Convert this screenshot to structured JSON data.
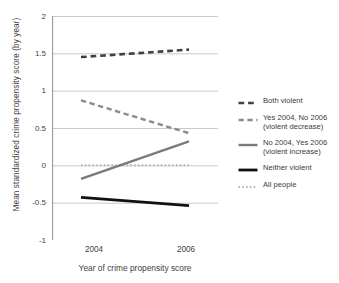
{
  "chart_data": {
    "type": "line",
    "title": "",
    "xlabel": "Year of crime propensity score",
    "ylabel": "Mean standardized crime propensity score (by year)",
    "categories": [
      "2004",
      "2006"
    ],
    "x": [
      2004,
      2006
    ],
    "ylim": [
      -1,
      2
    ],
    "yticks": [
      "2",
      "1.5",
      "1",
      "0.5",
      "0",
      "-0.5",
      "-1"
    ],
    "ytick_values": [
      2,
      1.5,
      1,
      0.5,
      0,
      -0.5,
      -1
    ],
    "grid": true,
    "legend_position": "right",
    "series": [
      {
        "name": "Both violent",
        "label": "Both violent",
        "values": [
          1.45,
          1.55
        ],
        "style": "dashed",
        "color": "#404040",
        "width": 2.6
      },
      {
        "name": "Yes 2004, No 2006 (violent decrease)",
        "label": "Yes 2004, No 2006\n(violent decrease)",
        "values": [
          0.87,
          0.43
        ],
        "style": "dashed",
        "color": "#8a8a8a",
        "width": 2.4
      },
      {
        "name": "No 2004, Yes 2006 (violent increase)",
        "label": "No 2004, Yes 2006\n(violent increase)",
        "values": [
          -0.18,
          0.32
        ],
        "style": "solid",
        "color": "#7a7a7a",
        "width": 2.4
      },
      {
        "name": "Neither violent",
        "label": "Neither violent",
        "values": [
          -0.43,
          -0.54
        ],
        "style": "solid",
        "color": "#111111",
        "width": 2.8
      },
      {
        "name": "All people",
        "label": "All people",
        "values": [
          0.0,
          0.0
        ],
        "style": "dotted",
        "color": "#b4b4b4",
        "width": 2.0
      }
    ]
  },
  "axes": {
    "y_title": "Mean standardized crime propensity score (by year)",
    "x_title": "Year of crime propensity score",
    "y_ticks": [
      "2",
      "1.5",
      "1",
      "0.5",
      "0",
      "-0.5",
      "-1"
    ],
    "x_ticks": [
      "2004",
      "2006"
    ]
  },
  "legend": {
    "items": [
      {
        "label": "Both violent"
      },
      {
        "label": "Yes 2004, No 2006\n(violent decrease)"
      },
      {
        "label": "No 2004, Yes 2006\n(violent increase)"
      },
      {
        "label": "Neither violent"
      },
      {
        "label": "All people"
      }
    ]
  }
}
